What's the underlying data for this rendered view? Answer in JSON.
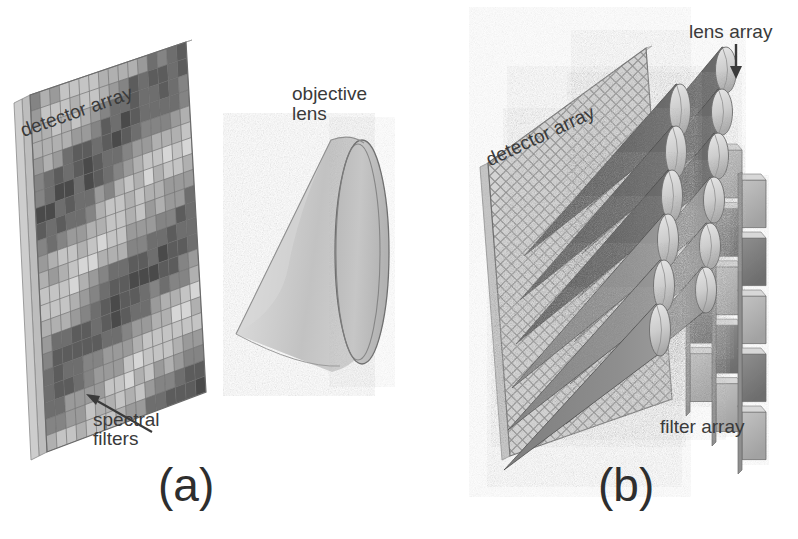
{
  "figure": {
    "background_color": "#ffffff",
    "text_color": "#3a3a3a",
    "panels": [
      {
        "caption": "(a)",
        "labels": [
          {
            "name": "detector array",
            "text": "detector array"
          },
          {
            "name": "objective lens",
            "text": "objective\nlens"
          },
          {
            "name": "spectral filters",
            "text": "spectral\nfilters"
          }
        ]
      },
      {
        "caption": "(b)",
        "labels": [
          {
            "name": "detector array",
            "text": "detector array"
          },
          {
            "name": "lens array",
            "text": "lens array"
          },
          {
            "name": "filter array",
            "text": "filter array"
          }
        ]
      }
    ]
  },
  "panel_a": {
    "caption": "(a)",
    "label_detector_array": "detector array",
    "label_objective_lens_line1": "objective",
    "label_objective_lens_line2": "lens",
    "label_spectral_filters_line1": "spectral",
    "label_spectral_filters_line2": "filters"
  },
  "panel_b": {
    "caption": "(b)",
    "label_detector_array": "detector array",
    "label_lens_array": "lens array",
    "label_filter_array": "filter array"
  },
  "colors": {
    "text": "#3a3a3a",
    "caption": "#2e2e2e",
    "arrow": "#3a3a3a",
    "panel_light": "#c9c9c9",
    "panel_mid": "#9a9a9a",
    "panel_dark": "#6b6b6b",
    "panel_darker": "#4e4e4e",
    "lens_body": "#cfcfcf",
    "lens_face": "#bdbdbd",
    "lens_outline": "#6f6f6f",
    "cone_dark": "#5a5a5a",
    "cone_mid": "#7d7d7d",
    "filter_tile": "#b3b3b3",
    "filter_tile_dark": "#8a8a8a",
    "mesh_line": "#7a7a7a"
  },
  "geometry": {
    "panel_a_detector_grid_cols": 16,
    "panel_a_detector_grid_rows": 22,
    "panel_b_detector_mesh": "diamond",
    "panel_b_cone_rows": 6,
    "panel_b_cone_cols": 3,
    "panel_b_filter_rows": 5,
    "panel_b_filter_cols": 3
  }
}
